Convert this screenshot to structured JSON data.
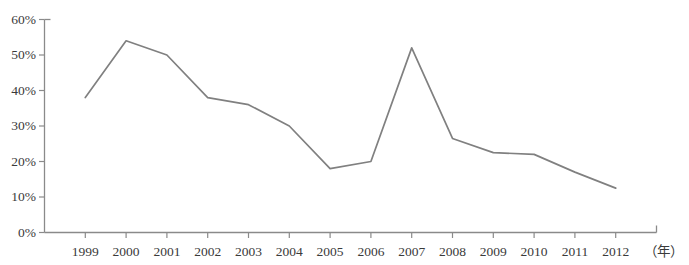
{
  "chart_data": {
    "type": "line",
    "title": "",
    "subtitle": "",
    "xlabel": "（年）",
    "ylabel": "",
    "categories": [
      "1999",
      "2000",
      "2001",
      "2002",
      "2003",
      "2004",
      "2005",
      "2006",
      "2007",
      "2008",
      "2009",
      "2010",
      "2011",
      "2012"
    ],
    "values": [
      38,
      54,
      50,
      38,
      36,
      30,
      18,
      20,
      52,
      26.5,
      22.5,
      22,
      17,
      12.5
    ],
    "series": [
      {
        "name": "",
        "values": [
          38,
          54,
          50,
          38,
          36,
          30,
          18,
          20,
          52,
          26.5,
          22.5,
          22,
          17,
          12.5
        ]
      }
    ],
    "ytick_labels": [
      "0%",
      "10%",
      "20%",
      "30%",
      "40%",
      "50%",
      "60%"
    ],
    "ytick_values": [
      0,
      10,
      20,
      30,
      40,
      50,
      60
    ],
    "ylim": [
      0,
      60
    ],
    "grid": false,
    "legend": false,
    "legend_position": "none",
    "line_color": "#808080",
    "axis_color": "#808080",
    "text_color": "#3a3a3a",
    "background_color": "#ffffff",
    "markers": false,
    "annotations": []
  },
  "axis": {
    "x_unit": "（年）"
  }
}
